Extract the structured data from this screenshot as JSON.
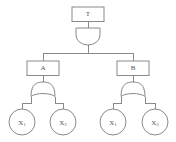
{
  "diagram": {
    "type": "fault-tree",
    "colors": {
      "stroke": "#8a8a8a",
      "text": "#555555",
      "background": "#ffffff",
      "node_fill": "#ffffff"
    },
    "top_event": {
      "id": "T",
      "label": "T",
      "shape": "rectangle"
    },
    "gates": [
      {
        "id": "gate-top",
        "type": "AND",
        "symbol": "and-gate",
        "parent": "T",
        "children": [
          "A",
          "B"
        ]
      },
      {
        "id": "gate-a",
        "type": "OR",
        "symbol": "or-gate",
        "parent": "A",
        "children": [
          "X1-left",
          "X2-left"
        ]
      },
      {
        "id": "gate-b",
        "type": "OR",
        "symbol": "or-gate",
        "parent": "B",
        "children": [
          "X1-right",
          "X2-right"
        ]
      }
    ],
    "intermediate_events": [
      {
        "id": "A",
        "label": "A",
        "shape": "rectangle"
      },
      {
        "id": "B",
        "label": "B",
        "shape": "rectangle"
      }
    ],
    "basic_events": [
      {
        "id": "X1-left",
        "label": "X",
        "subscript": "1",
        "shape": "circle"
      },
      {
        "id": "X2-left",
        "label": "X",
        "subscript": "2",
        "shape": "circle"
      },
      {
        "id": "X1-right",
        "label": "X",
        "subscript": "1",
        "shape": "circle"
      },
      {
        "id": "X2-right",
        "label": "X",
        "subscript": "2",
        "shape": "circle"
      }
    ]
  }
}
